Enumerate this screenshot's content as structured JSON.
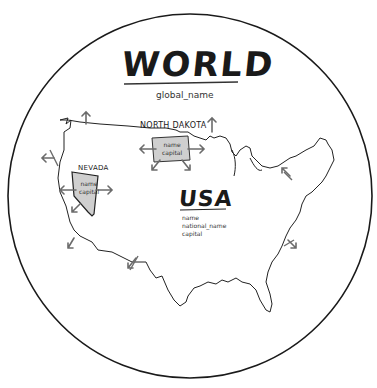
{
  "diagram": {
    "world": {
      "title": "WORLD",
      "attribute": "global_name"
    },
    "country": {
      "title": "USA",
      "attributes": [
        "name",
        "national_name",
        "capital"
      ]
    },
    "states": [
      {
        "title": "NORTH DAKOTA",
        "attributes": [
          "name",
          "capital"
        ]
      },
      {
        "title": "NEVADA",
        "attributes": [
          "name",
          "capital"
        ]
      }
    ],
    "colors": {
      "ink": "#1a1a1a",
      "state_fill": "#cfcfcf",
      "arrow": "#6b6b6b",
      "background": "#ffffff"
    }
  }
}
